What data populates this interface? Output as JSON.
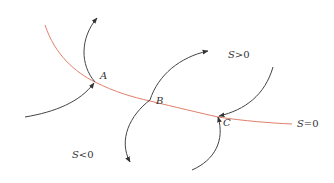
{
  "diagram": {
    "colors": {
      "switching_line": "#e0806a",
      "trajectory": "#444444",
      "text": "#333333",
      "background": "#ffffff"
    },
    "switching_line": {
      "label_var": "S",
      "label_rest": "=0",
      "path": "M45,25 C55,55 75,72 95,82 C115,92 132,97 150,101 C175,107 200,113 218,117 C245,121 270,123 292,124"
    },
    "regions": {
      "positive": {
        "var": "S",
        "rest": ">0"
      },
      "negative": {
        "var": "S",
        "rest": "<0"
      }
    },
    "points": [
      {
        "id": "A",
        "label": "A"
      },
      {
        "id": "B",
        "label": "B"
      },
      {
        "id": "C",
        "label": "C"
      }
    ],
    "trajectories": [
      {
        "name": "trajectory-into-A",
        "path": "M25,117 C55,112 80,102 94,83"
      },
      {
        "name": "trajectory-out-of-A",
        "path": "M95,82 C80,65 80,38 97,18"
      },
      {
        "name": "trajectory-into-B-from-below",
        "path": "M130,162 C118,140 130,115 150,100"
      },
      {
        "name": "trajectory-out-of-B",
        "path": "M150,100 C158,75 180,57 208,51"
      },
      {
        "name": "trajectory-into-C",
        "path": "M273,67 C265,95 245,110 219,116"
      },
      {
        "name": "trajectory-out-of-C",
        "path": "M218,117 C225,140 215,160 192,170"
      }
    ]
  }
}
